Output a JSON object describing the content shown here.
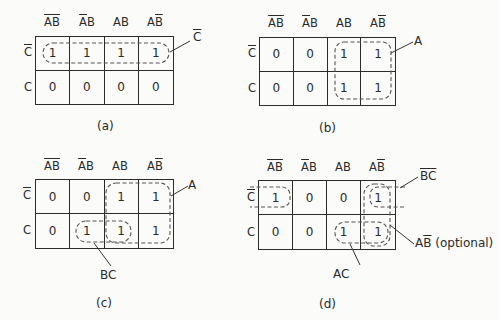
{
  "columns": [
    {
      "label": "AB",
      "overline": "both",
      "display": "A̅B̅"
    },
    {
      "label": "AB",
      "overline": "A",
      "display": "A̅B"
    },
    {
      "label": "AB",
      "overline": "none",
      "display": "AB"
    },
    {
      "label": "AB",
      "overline": "B",
      "display": "AB̅"
    }
  ],
  "rows": [
    {
      "label": "C",
      "overline": true
    },
    {
      "label": "C",
      "overline": false
    }
  ],
  "maps": [
    {
      "caption": "(a)",
      "cells": [
        [
          "1",
          "1",
          "1",
          "1"
        ],
        [
          "0",
          "0",
          "0",
          "0"
        ]
      ],
      "groups": [
        {
          "label": "C",
          "label_overline": true,
          "term": "C̅",
          "cells": "row 1 all"
        }
      ]
    },
    {
      "caption": "(b)",
      "cells": [
        [
          "0",
          "0",
          "1",
          "1"
        ],
        [
          "0",
          "0",
          "1",
          "1"
        ]
      ],
      "groups": [
        {
          "label": "A",
          "term": "A",
          "cells": "cols AB, AB̅"
        }
      ]
    },
    {
      "caption": "(c)",
      "cells": [
        [
          "0",
          "0",
          "1",
          "1"
        ],
        [
          "0",
          "1",
          "1",
          "1"
        ]
      ],
      "groups": [
        {
          "label": "A",
          "term": "A"
        },
        {
          "label": "BC",
          "term": "BC"
        }
      ]
    },
    {
      "caption": "(d)",
      "cells": [
        [
          "1",
          "0",
          "0",
          "1"
        ],
        [
          "0",
          "0",
          "1",
          "1"
        ]
      ],
      "groups": [
        {
          "label": "BC",
          "term": "B̅C̅",
          "label_overline": true
        },
        {
          "label": "AC",
          "term": "AC"
        },
        {
          "label_main": "AB",
          "label_suffix": "(optional)",
          "term": "AB̅ (optional)"
        }
      ]
    }
  ],
  "labels": {
    "a_group": "C",
    "b_group": "A",
    "c_group_a": "A",
    "c_group_bc": "BC",
    "d_group_bc": "BC",
    "d_group_ac": "AC",
    "d_group_ab_main": "AB",
    "d_group_ab_suffix": " (optional)"
  },
  "colors": {
    "line": "#2b2b2b",
    "dashed": "#555555",
    "background": "#fbfbf9"
  }
}
